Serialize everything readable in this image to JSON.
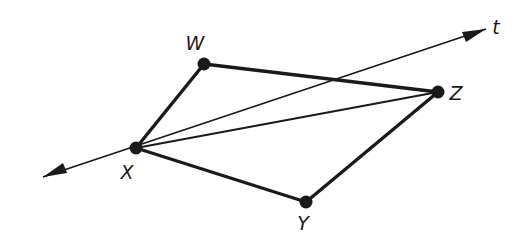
{
  "figure": {
    "background_color": "#ffffff",
    "stroke_color": "#1a1a1a",
    "width": 519,
    "height": 245
  },
  "points": [
    {
      "id": "W",
      "label": "W",
      "x": 204,
      "y": 64,
      "label_x": 195,
      "label_y": 50,
      "dot_radius": 6
    },
    {
      "id": "X",
      "label": "X",
      "x": 136,
      "y": 148,
      "label_x": 127,
      "label_y": 179,
      "dot_radius": 6
    },
    {
      "id": "Y",
      "label": "Y",
      "x": 306,
      "y": 202,
      "label_x": 300,
      "label_y": 230,
      "dot_radius": 6
    },
    {
      "id": "Z",
      "label": "Z",
      "x": 438,
      "y": 92,
      "label_x": 452,
      "label_y": 100,
      "dot_radius": 6
    }
  ],
  "segments": [
    {
      "id": "WX",
      "from": "W",
      "to": "X",
      "width": 3.4,
      "style": "solid"
    },
    {
      "id": "WZ",
      "from": "W",
      "to": "Z",
      "width": 3.4,
      "style": "solid"
    },
    {
      "id": "XY",
      "from": "X",
      "to": "Y",
      "width": 3.4,
      "style": "solid"
    },
    {
      "id": "YZ",
      "from": "Y",
      "to": "Z",
      "width": 3.4,
      "style": "solid"
    },
    {
      "id": "XZ",
      "from": "X",
      "to": "Z",
      "width": 1.8,
      "style": "solid"
    }
  ],
  "lines": [
    {
      "id": "t",
      "label": "t",
      "through": "X",
      "arrow_start_x": 43,
      "arrow_start_y": 177,
      "arrow_end_x": 486,
      "arrow_end_y": 29,
      "width": 1.8,
      "arrows": "both",
      "label_x": 494,
      "label_y": 34
    }
  ],
  "intersections": [
    {
      "id": "t-WZ",
      "x": 332,
      "y": 82,
      "note": "line t crosses segment WZ"
    }
  ]
}
